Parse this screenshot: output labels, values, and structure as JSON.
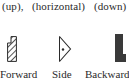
{
  "top_row": {
    "labels": [
      "(up),",
      "(horizontal)",
      "(down)"
    ]
  },
  "icons": [
    {
      "name": "forward-icon",
      "label": "Forward",
      "style": "hatched-notched-bar"
    },
    {
      "name": "side-icon",
      "label": "Side",
      "style": "triangle-with-dot"
    },
    {
      "name": "backward-icon",
      "label": "Backward",
      "style": "solid-notched-bar"
    }
  ],
  "colors": {
    "ink": "#2a2a2a",
    "backward_fill": "#3a3a3a",
    "background": "#ffffff"
  }
}
